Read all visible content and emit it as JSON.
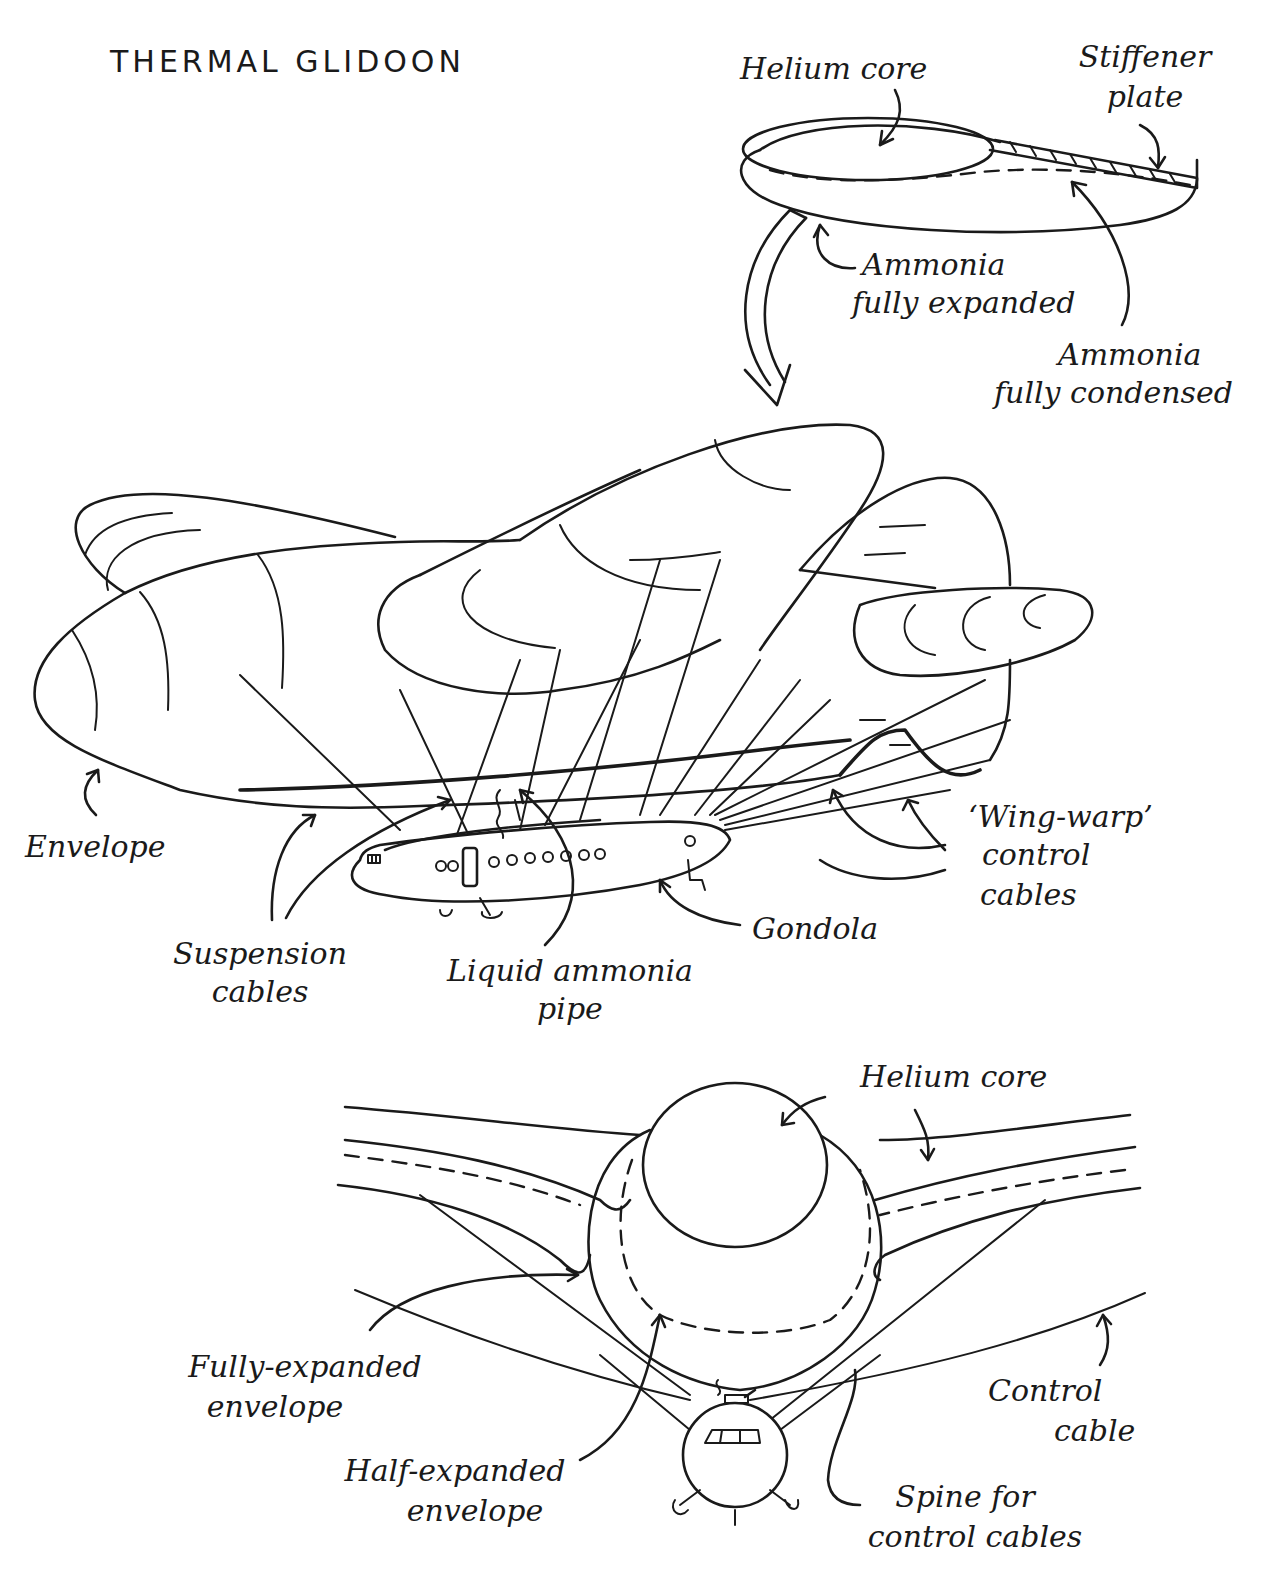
{
  "title": "THERMAL GLIDOON",
  "colors": {
    "ink": "#1a1a1a",
    "paper": "#ffffff"
  },
  "panels": {
    "cross_section_top": {
      "labels": {
        "helium_core": "Helium core",
        "stiffener_plate_1": "Stiffener",
        "stiffener_plate_2": "plate",
        "ammonia_expanded_1": "Ammonia",
        "ammonia_expanded_2": "fully expanded",
        "ammonia_condensed_1": "Ammonia",
        "ammonia_condensed_2": "fully condensed"
      }
    },
    "side_view": {
      "labels": {
        "envelope": "Envelope",
        "suspension_cables_1": "Suspension",
        "suspension_cables_2": "cables",
        "liquid_ammonia_pipe_1": "Liquid ammonia",
        "liquid_ammonia_pipe_2": "pipe",
        "gondola": "Gondola",
        "wing_warp_1": "‘Wing-warp’",
        "wing_warp_2": "control",
        "wing_warp_3": "cables"
      }
    },
    "front_view": {
      "labels": {
        "helium_core": "Helium core",
        "fully_expanded_1": "Fully-expanded",
        "fully_expanded_2": "envelope",
        "half_expanded_1": "Half-expanded",
        "half_expanded_2": "envelope",
        "control_cable_1": "Control",
        "control_cable_2": "cable",
        "spine_1": "Spine for",
        "spine_2": "control cables"
      }
    }
  }
}
